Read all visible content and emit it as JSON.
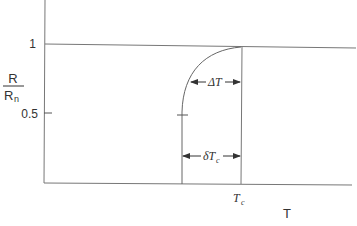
{
  "diagram": {
    "y_axis": {
      "label_numerator": "R",
      "label_denominator": "R",
      "label_denominator_sub": "n",
      "ticks": [
        "1",
        "0.5"
      ]
    },
    "x_axis": {
      "label": "T",
      "tick_label": "T",
      "tick_label_sub": "c"
    },
    "annotations": {
      "delta_T": "ΔT",
      "delta_Tc": "δT",
      "delta_Tc_sub": "c"
    }
  }
}
